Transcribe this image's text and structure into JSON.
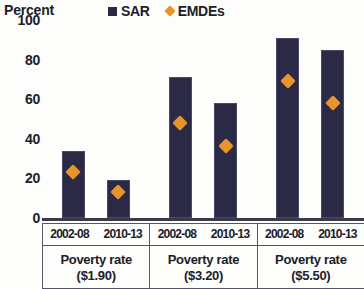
{
  "chart_data": {
    "type": "bar",
    "title": "",
    "ylabel": "Percent",
    "xlabel": "",
    "ylim": [
      0,
      100
    ],
    "yticks": [
      0,
      20,
      40,
      60,
      80,
      100
    ],
    "ytick_labels": [
      "0",
      "20",
      "40",
      "60",
      "80",
      "100"
    ],
    "grid": false,
    "legend_position": "top",
    "categories": [
      "2002-08",
      "2010-13",
      "2002-08",
      "2010-13",
      "2002-08",
      "2010-13"
    ],
    "groups": [
      {
        "label_line1": "Poverty rate",
        "label_line2": "($1.90)",
        "periods": [
          "2002-08",
          "2010-13"
        ]
      },
      {
        "label_line1": "Poverty rate",
        "label_line2": "($3.20)",
        "periods": [
          "2002-08",
          "2010-13"
        ]
      },
      {
        "label_line1": "Poverty rate",
        "label_line2": "($5.50)",
        "periods": [
          "2002-08",
          "2010-13"
        ]
      }
    ],
    "series": [
      {
        "name": "SAR",
        "marker": "bar",
        "color": "#2a2a46",
        "values": [
          34,
          19,
          71,
          58,
          91,
          85
        ]
      },
      {
        "name": "EMDEs",
        "marker": "diamond",
        "color": "#e8942c",
        "values": [
          26,
          16,
          51,
          39,
          72,
          61
        ]
      }
    ]
  },
  "legend": {
    "items": [
      {
        "label": "SAR",
        "swatch": "square",
        "color": "#2a2a46"
      },
      {
        "label": "EMDEs",
        "swatch": "diamond",
        "color": "#e8942c"
      }
    ]
  }
}
